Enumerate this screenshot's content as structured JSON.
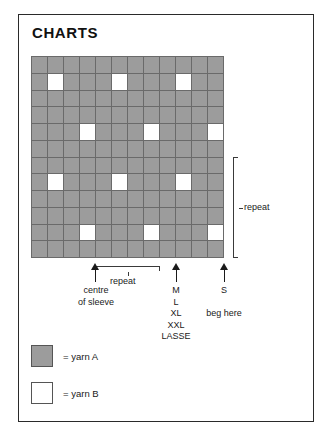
{
  "page": {
    "title": "CHARTS"
  },
  "chart_data": {
    "type": "heatmap",
    "title": "CHARTS",
    "columns": 12,
    "rows": 12,
    "xlabel": "",
    "ylabel": "",
    "grid": true,
    "legend_position": "below-chart",
    "value_labels": {
      "yarn_a": "= yarn A",
      "yarn_b": "= yarn B"
    },
    "colors": {
      "yarn_a": "#9c9c9c",
      "yarn_b": "#ffffff",
      "gridline": "#6a6a6a",
      "annotation": "#1a1a1a"
    },
    "cells": [
      [
        "A",
        "A",
        "A",
        "A",
        "A",
        "A",
        "A",
        "A",
        "A",
        "A",
        "A",
        "A"
      ],
      [
        "A",
        "B",
        "A",
        "A",
        "A",
        "B",
        "A",
        "A",
        "A",
        "B",
        "A",
        "A"
      ],
      [
        "A",
        "A",
        "A",
        "A",
        "A",
        "A",
        "A",
        "A",
        "A",
        "A",
        "A",
        "A"
      ],
      [
        "A",
        "A",
        "A",
        "A",
        "A",
        "A",
        "A",
        "A",
        "A",
        "A",
        "A",
        "A"
      ],
      [
        "A",
        "A",
        "A",
        "B",
        "A",
        "A",
        "A",
        "B",
        "A",
        "A",
        "A",
        "B"
      ],
      [
        "A",
        "A",
        "A",
        "A",
        "A",
        "A",
        "A",
        "A",
        "A",
        "A",
        "A",
        "A"
      ],
      [
        "A",
        "A",
        "A",
        "A",
        "A",
        "A",
        "A",
        "A",
        "A",
        "A",
        "A",
        "A"
      ],
      [
        "A",
        "B",
        "A",
        "A",
        "A",
        "B",
        "A",
        "A",
        "A",
        "B",
        "A",
        "A"
      ],
      [
        "A",
        "A",
        "A",
        "A",
        "A",
        "A",
        "A",
        "A",
        "A",
        "A",
        "A",
        "A"
      ],
      [
        "A",
        "A",
        "A",
        "A",
        "A",
        "A",
        "A",
        "A",
        "A",
        "A",
        "A",
        "A"
      ],
      [
        "A",
        "A",
        "A",
        "B",
        "A",
        "A",
        "A",
        "B",
        "A",
        "A",
        "A",
        "B"
      ],
      [
        "A",
        "A",
        "A",
        "A",
        "A",
        "A",
        "A",
        "A",
        "A",
        "A",
        "A",
        "A"
      ]
    ],
    "repeat_horizontal": {
      "label": "repeat",
      "stitches": 4,
      "from_column": 5,
      "to_column": 8
    },
    "repeat_vertical": {
      "label": "repeat",
      "rows": 6,
      "from_row": 7,
      "to_row": 12
    },
    "markers": [
      {
        "label": "centre\nof sleeve",
        "column_edge": 4
      },
      {
        "label": "M\nL\nXL\nXXL\nLASSE",
        "column_edge": 9
      },
      {
        "label": "S\n\nbeg here",
        "column_edge": 12
      }
    ]
  },
  "annotations": {
    "repeat_vertical_label": "repeat",
    "repeat_horizontal_label": "repeat",
    "centre_line1": "centre",
    "centre_line2": "of sleeve",
    "sizes_line1": "M",
    "sizes_line2": "L",
    "sizes_line3": "XL",
    "sizes_line4": "XXL",
    "sizes_line5": "LASSE",
    "size_s": "S",
    "beg_here": "beg here"
  },
  "legend": {
    "items": [
      {
        "swatch": "yarn-a",
        "text": "= yarn A"
      },
      {
        "swatch": "yarn-b",
        "text": "= yarn B"
      }
    ]
  }
}
